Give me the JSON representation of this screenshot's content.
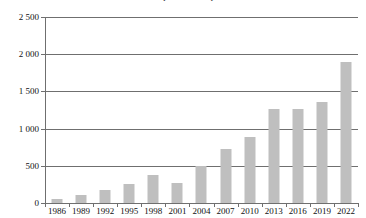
{
  "chart_data": {
    "type": "bar",
    "title": "Nombre de publications par année",
    "xlabel": "",
    "ylabel": "",
    "ylim": [
      0,
      2500
    ],
    "ytick_values": [
      0,
      500,
      1000,
      1500,
      2000,
      2500
    ],
    "ytick_labels": [
      "0",
      "500",
      "1 000",
      "1 500",
      "2 000",
      "2 500"
    ],
    "grid": true,
    "legend": false,
    "bar_color": "#bfbfbf",
    "axis_color": "#6f6f6f",
    "categories": [
      "1986",
      "1989",
      "1992",
      "1995",
      "1998",
      "2001",
      "2004",
      "2007",
      "2010",
      "2013",
      "2016",
      "2019",
      "2022"
    ],
    "values": [
      60,
      110,
      170,
      260,
      370,
      270,
      500,
      730,
      890,
      1260,
      1270,
      1360,
      1900
    ]
  }
}
